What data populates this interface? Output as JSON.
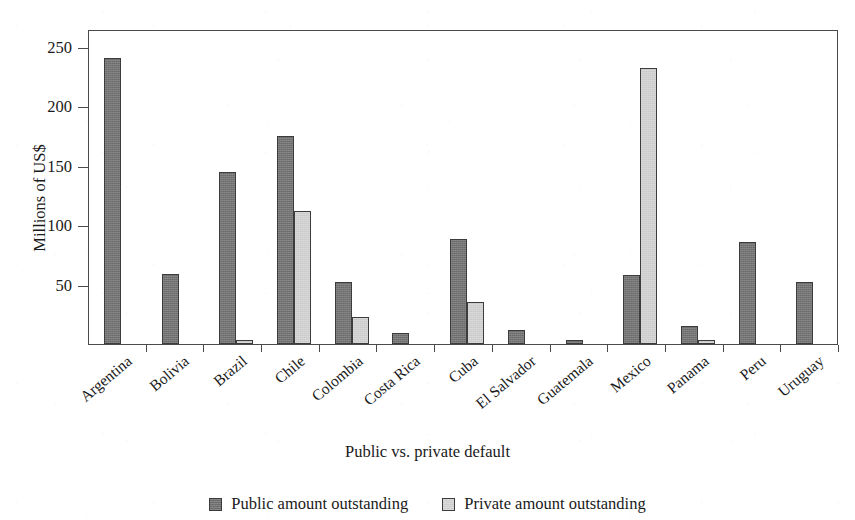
{
  "chart_data": {
    "type": "bar",
    "title": "",
    "xlabel": "Public vs. private default",
    "ylabel": "Millions of US$",
    "ylim": [
      0,
      265
    ],
    "yticks": [
      50,
      100,
      150,
      200,
      250
    ],
    "ytick_labels": [
      "50",
      "100",
      "150",
      "200",
      "250"
    ],
    "grid": false,
    "legend_position": "bottom-center",
    "categories": [
      "Argentina",
      "Bolivia",
      "Brazil",
      "Chile",
      "Colombia",
      "Costa Rica",
      "Cuba",
      "El Salvador",
      "Guatemala",
      "Mexico",
      "Panama",
      "Peru",
      "Uruguay"
    ],
    "series": [
      {
        "name": "Public amount outstanding",
        "color": "#6f6f6f",
        "values": [
          241,
          59,
          145,
          175,
          52,
          9,
          88,
          12,
          3,
          58,
          15,
          86,
          52
        ]
      },
      {
        "name": "Private amount outstanding",
        "color": "#d2d2d2",
        "values": [
          0,
          0,
          3,
          112,
          23,
          0,
          35,
          0,
          0,
          232,
          3,
          0,
          0
        ]
      }
    ]
  },
  "axis": {
    "y_title": "Millions of US$",
    "x_title": "Public vs. private default"
  },
  "legend": {
    "items": [
      {
        "label": "Public amount outstanding",
        "swatch": "public"
      },
      {
        "label": "Private amount outstanding",
        "swatch": "private"
      }
    ]
  },
  "colors": {
    "public_bar": "#6f6f6f",
    "private_bar": "#d2d2d2",
    "axis_line": "#4a4a4a",
    "text": "#1a1a1a",
    "background": "#ffffff"
  }
}
